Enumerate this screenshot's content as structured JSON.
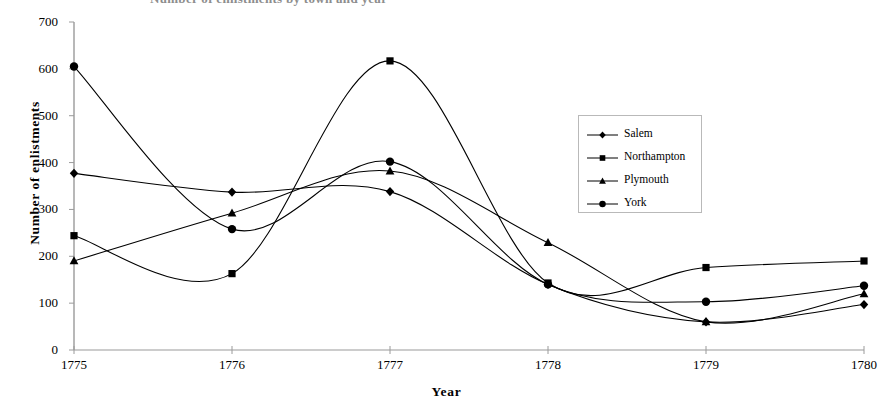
{
  "title": "Number of enlistments by town and year",
  "chart_data": {
    "type": "line",
    "title": "Number of enlistments by town and year",
    "xlabel": "Year",
    "ylabel": "Number of  enlistments",
    "categories": [
      "1775",
      "1776",
      "1777",
      "1778",
      "1779",
      "1780"
    ],
    "x": [
      1775,
      1776,
      1777,
      1778,
      1779,
      1780
    ],
    "xlim": [
      1775,
      1780
    ],
    "ylim": [
      0,
      700
    ],
    "ytick_labels": [
      "0",
      "100",
      "200",
      "300",
      "400",
      "500",
      "600",
      "700"
    ],
    "yticks": [
      0,
      100,
      200,
      300,
      400,
      500,
      600,
      700
    ],
    "grid": false,
    "smoothed": true,
    "legend_position": "center-right",
    "series": [
      {
        "name": "Salem",
        "marker": "diamond",
        "color": "#000000",
        "values": [
          377,
          337,
          338,
          140,
          60,
          97
        ]
      },
      {
        "name": "Northampton",
        "marker": "square",
        "color": "#000000",
        "values": [
          244,
          163,
          617,
          143,
          176,
          190
        ]
      },
      {
        "name": "Plymouth",
        "marker": "triangle",
        "color": "#000000",
        "values": [
          190,
          292,
          382,
          229,
          60,
          120
        ]
      },
      {
        "name": "York",
        "marker": "circle",
        "color": "#000000",
        "values": [
          605,
          258,
          402,
          140,
          103,
          137
        ]
      }
    ]
  },
  "legend": {
    "items": [
      {
        "label": "Salem",
        "marker": "diamond"
      },
      {
        "label": "Northampton",
        "marker": "square"
      },
      {
        "label": "Plymouth",
        "marker": "triangle"
      },
      {
        "label": "York",
        "marker": "circle"
      }
    ]
  }
}
